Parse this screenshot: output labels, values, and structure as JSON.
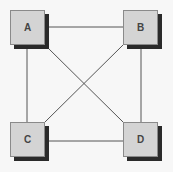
{
  "diagram": {
    "nodes": [
      {
        "id": "A",
        "label": "A",
        "x": 10,
        "y": 10
      },
      {
        "id": "B",
        "label": "B",
        "x": 123,
        "y": 10
      },
      {
        "id": "C",
        "label": "C",
        "x": 10,
        "y": 122
      },
      {
        "id": "D",
        "label": "D",
        "x": 123,
        "y": 122
      }
    ],
    "edges": [
      [
        "A",
        "B"
      ],
      [
        "A",
        "C"
      ],
      [
        "A",
        "D"
      ],
      [
        "B",
        "C"
      ],
      [
        "B",
        "D"
      ],
      [
        "C",
        "D"
      ]
    ],
    "colors": {
      "box": "#d4d4d4",
      "shadow": "#2a2a2a",
      "line": "#555555"
    }
  }
}
